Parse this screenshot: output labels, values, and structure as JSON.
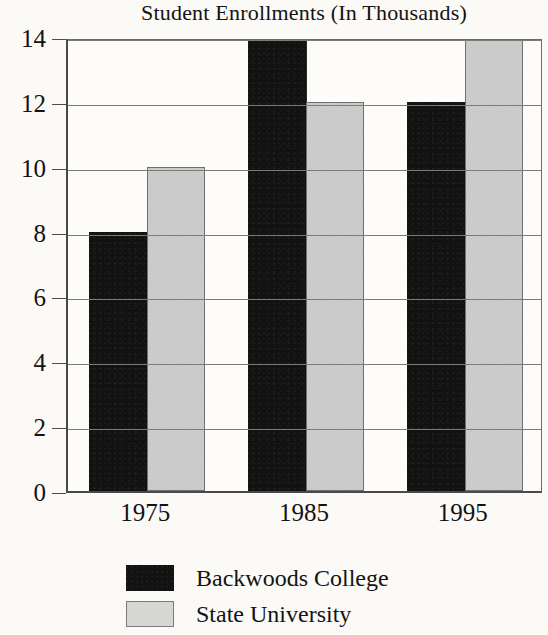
{
  "chart_data": {
    "type": "bar",
    "title": "Student Enrollments (In Thousands)",
    "xlabel": "",
    "ylabel": "",
    "categories": [
      "1975",
      "1985",
      "1995"
    ],
    "series": [
      {
        "name": "Backwoods College",
        "color": "#121212",
        "values": [
          8,
          14,
          12
        ]
      },
      {
        "name": "State University",
        "color": "#c2c2c2",
        "values": [
          10,
          12,
          14
        ]
      }
    ],
    "ylim": [
      0,
      14
    ],
    "yticks": [
      0,
      2,
      4,
      6,
      8,
      10,
      12,
      14
    ],
    "ytick_labels": [
      "0",
      "2",
      "4",
      "6",
      "8",
      "10",
      "12",
      "14"
    ],
    "grid": true,
    "legend_position": "bottom"
  },
  "legend": {
    "items": [
      {
        "label": "Backwoods College",
        "swatch": "dark-swatch"
      },
      {
        "label": "State University",
        "swatch": "light-swatch"
      }
    ]
  }
}
